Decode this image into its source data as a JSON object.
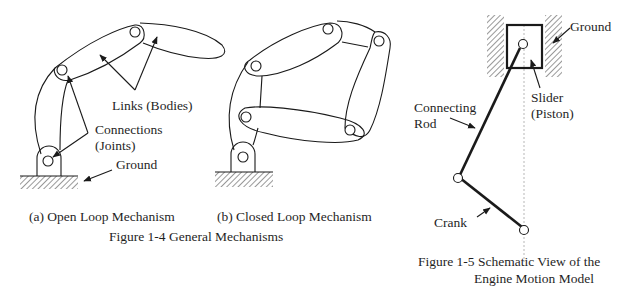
{
  "figure_1_4": {
    "caption": "Figure 1-4  General Mechanisms",
    "subfigure_a": {
      "caption": "(a) Open Loop Mechanism",
      "labels": {
        "links": "Links (Bodies)",
        "connections_line1": "Connections",
        "connections_line2": "(Joints)",
        "ground": "Ground"
      }
    },
    "subfigure_b": {
      "caption": "(b) Closed Loop Mechanism"
    }
  },
  "figure_1_5": {
    "caption_line1": "Figure 1-5  Schematic View of the",
    "caption_line2": "Engine Motion Model",
    "labels": {
      "ground": "Ground",
      "connecting_rod_line1": "Connecting",
      "connecting_rod_line2": "Rod",
      "slider_line1": "Slider",
      "slider_line2": "(Piston)",
      "crank": "Crank"
    }
  },
  "colors": {
    "line": "#1a1a1a",
    "background": "#ffffff",
    "centerline": "#9a9a9a"
  }
}
